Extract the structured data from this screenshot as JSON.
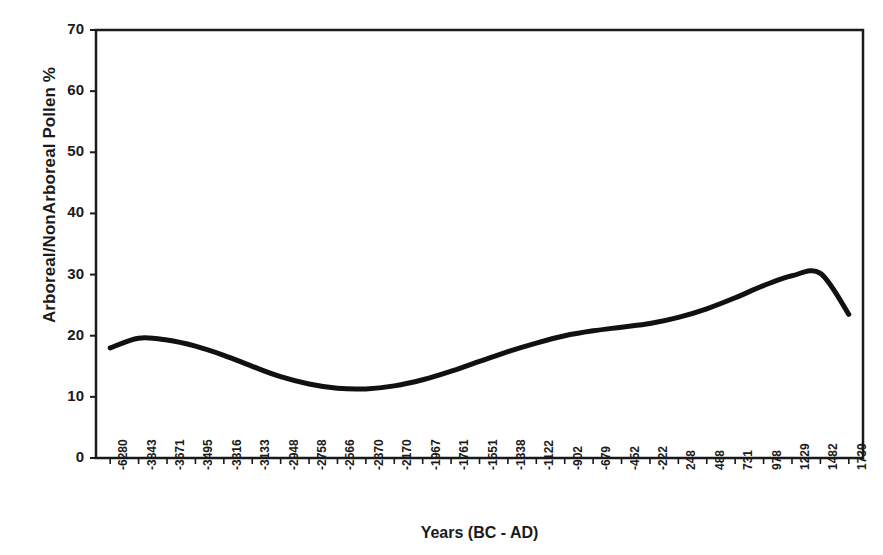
{
  "chart_data": {
    "type": "line",
    "title": "",
    "xlabel": "Years (BC - AD)",
    "ylabel": "Arboreal/NonArboreal Pollen %",
    "ylim": [
      0,
      70
    ],
    "yticks": [
      0,
      10,
      20,
      30,
      40,
      50,
      60,
      70
    ],
    "grid": false,
    "legend": false,
    "categories": [
      "-6280",
      "-3843",
      "-3671",
      "-3495",
      "-3316",
      "-3133",
      "-2948",
      "-2758",
      "-2566",
      "-2370",
      "-2170",
      "-1967",
      "-1761",
      "-1551",
      "-1338",
      "-1122",
      "-902",
      "-679",
      "-452",
      "-222",
      "248",
      "488",
      "731",
      "978",
      "1229",
      "1482",
      "1739"
    ],
    "x": [
      -6280,
      -3843,
      -3671,
      -3495,
      -3316,
      -3133,
      -2948,
      -2758,
      -2566,
      -2370,
      -2170,
      -1967,
      -1761,
      -1551,
      -1338,
      -1122,
      -902,
      -679,
      -452,
      -222,
      248,
      488,
      731,
      978,
      1229,
      1482,
      1739
    ],
    "values": [
      18.0,
      19.6,
      19.3,
      18.3,
      16.8,
      15.0,
      13.3,
      12.1,
      11.4,
      11.3,
      11.8,
      12.8,
      14.2,
      15.8,
      17.4,
      18.8,
      20.0,
      20.8,
      21.4,
      22.0,
      23.0,
      24.4,
      26.2,
      28.2,
      29.8,
      30.2,
      23.5
    ],
    "series_name": "Arboreal/NonArboreal Pollen %",
    "line_color": "#111111",
    "line_width": 5
  },
  "axis": {
    "y_tick_labels": [
      "70",
      "60",
      "50",
      "40",
      "30",
      "20",
      "10",
      "0"
    ]
  }
}
